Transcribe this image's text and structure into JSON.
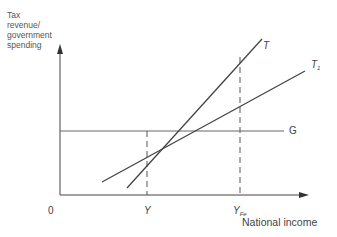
{
  "diagram": {
    "y_axis_label": [
      "Tax",
      "revenue/",
      "government",
      "spending"
    ],
    "x_axis_label": "National income",
    "origin_label": "0",
    "lines": [
      {
        "name": "T",
        "label": "T",
        "subscript": "",
        "type": "solid"
      },
      {
        "name": "T1",
        "label": "T",
        "subscript": "1",
        "type": "solid"
      },
      {
        "name": "G",
        "label": "G",
        "subscript": "",
        "type": "solid-horizontal"
      }
    ],
    "x_markers": [
      {
        "label": "Y",
        "subscript": "",
        "type": "dashed"
      },
      {
        "label": "Y",
        "subscript": "Fe",
        "type": "dashed"
      }
    ]
  },
  "colors": {
    "line": "#555555",
    "axis": "#444444",
    "background": "#ffffff"
  }
}
